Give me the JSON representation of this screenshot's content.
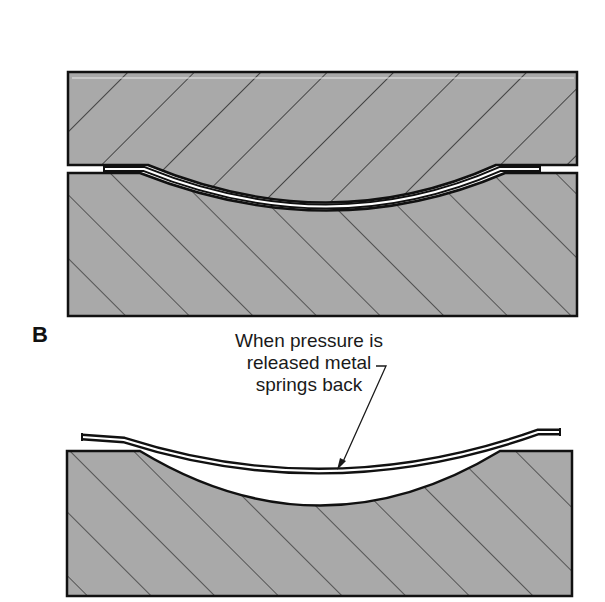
{
  "figure": {
    "section_label": "B",
    "callout": {
      "lines": [
        "When pressure is",
        "released metal",
        "springs back"
      ]
    }
  },
  "colors": {
    "die_fill": "#a9a9a9",
    "outline": "#111111",
    "hatch": "#1a1a1a",
    "sheet_fill": "#ffffff",
    "background": "#ffffff"
  }
}
